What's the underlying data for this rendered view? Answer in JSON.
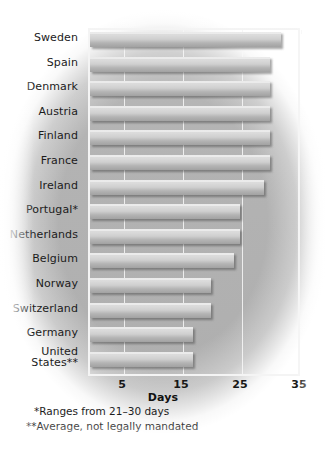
{
  "chart_data": {
    "type": "bar",
    "orientation": "horizontal",
    "title": "",
    "subtitle": "",
    "xlabel": "Days",
    "ylabel": "",
    "xlim": [
      0,
      35
    ],
    "xticks": [
      5,
      15,
      25,
      35
    ],
    "xtick_labels": [
      "5",
      "15",
      "25",
      "35"
    ],
    "grid": true,
    "grid_axis": "x",
    "legend": null,
    "categories": [
      "Sweden",
      "Spain",
      "Denmark",
      "Austria",
      "Finland",
      "France",
      "Ireland",
      "Portugal*",
      "Netherlands",
      "Belgium",
      "Norway",
      "Switzerland",
      "Germany",
      "United\nStates**"
    ],
    "values": [
      32,
      30,
      30,
      30,
      30,
      30,
      29,
      25,
      25,
      24,
      20,
      20,
      17,
      17
    ],
    "annotations": [
      "*Ranges from 21–30 days",
      "**Average, not legally mandated"
    ],
    "colors": {
      "bar_light": "#dcdcdc",
      "bar_dark": "#a2a2a2",
      "background": "#b3b3b3",
      "frame": "#f4f4f4",
      "text": "#1b1b1b"
    }
  },
  "axis": {
    "x_title": "Days",
    "ticks": [
      {
        "label": "5",
        "value": 5
      },
      {
        "label": "15",
        "value": 15
      },
      {
        "label": "25",
        "value": 25
      },
      {
        "label": "35",
        "value": 35
      }
    ]
  },
  "footnotes": {
    "one": "*Ranges from 21–30 days",
    "two": "**Average, not legally mandated"
  }
}
